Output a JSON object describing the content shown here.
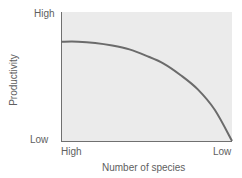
{
  "chart_data": {
    "type": "line",
    "title": "",
    "xlabel": "Number of species",
    "ylabel": "Productivity",
    "x_tick_labels": [
      "High",
      "Low"
    ],
    "y_tick_labels": [
      "High",
      "Low"
    ],
    "grid": false,
    "legend": null,
    "plot_background": "#ebebeb",
    "line_color": "#6b6b6b",
    "series": [
      {
        "name": "Productivity vs. number of species",
        "x": [
          0,
          0.1,
          0.2,
          0.3,
          0.4,
          0.5,
          0.6,
          0.7,
          0.8,
          0.9,
          1.0
        ],
        "y": [
          0.77,
          0.77,
          0.76,
          0.74,
          0.71,
          0.66,
          0.6,
          0.51,
          0.4,
          0.24,
          0.0
        ],
        "x_meaning": "0 = High number of species, 1 = Low number of species",
        "y_meaning": "0 = Low productivity, 1 = High productivity"
      }
    ],
    "xlim": [
      0,
      1
    ],
    "ylim": [
      0,
      1
    ]
  },
  "labels": {
    "y_high": "High",
    "y_low": "Low",
    "x_high": "High",
    "x_low": "Low",
    "x_title": "Number of species",
    "y_title": "Productivity"
  }
}
